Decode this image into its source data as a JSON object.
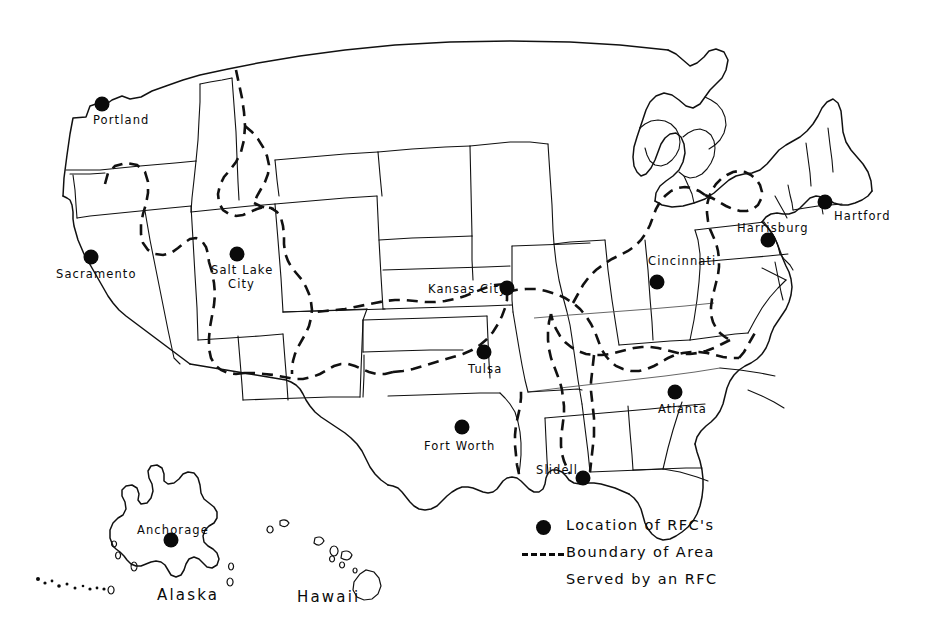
{
  "map": {
    "title": "Location of RFC's and Boundaries of Areas Served",
    "colors": {
      "ink": "#0a0a0a",
      "background": "#ffffff",
      "state_line": "#111111"
    },
    "cities": [
      {
        "name": "Portland",
        "label": "Portland",
        "dot_x": 102,
        "dot_y": 104,
        "label_x": 93,
        "label_y": 114,
        "anchor": "center"
      },
      {
        "name": "Sacramento",
        "label": "Sacramento",
        "dot_x": 91,
        "dot_y": 257,
        "label_x": 56,
        "label_y": 268,
        "anchor": "left"
      },
      {
        "name": "Salt Lake City",
        "label": "Salt Lake",
        "dot_x": 237,
        "dot_y": 254,
        "label_x": 211,
        "label_y": 264,
        "anchor": "left"
      },
      {
        "name": "Salt Lake City 2",
        "label": "City",
        "dot_x": 0,
        "dot_y": 0,
        "label_x": 228,
        "label_y": 278,
        "anchor": "left"
      },
      {
        "name": "Kansas City",
        "label": "Kansas City",
        "dot_x": 507,
        "dot_y": 288,
        "label_x": 428,
        "label_y": 283,
        "anchor": "left"
      },
      {
        "name": "Tulsa",
        "label": "Tulsa",
        "dot_x": 484,
        "dot_y": 352,
        "label_x": 468,
        "label_y": 363,
        "anchor": "left"
      },
      {
        "name": "Fort Worth",
        "label": "Fort Worth",
        "dot_x": 462,
        "dot_y": 427,
        "label_x": 424,
        "label_y": 440,
        "anchor": "left"
      },
      {
        "name": "Slidell",
        "label": "Slidell",
        "dot_x": 583,
        "dot_y": 478,
        "label_x": 536,
        "label_y": 464,
        "anchor": "left"
      },
      {
        "name": "Atlanta",
        "label": "Atlanta",
        "dot_x": 675,
        "dot_y": 392,
        "label_x": 658,
        "label_y": 403,
        "anchor": "left"
      },
      {
        "name": "Cincinnati",
        "label": "Cincinnati",
        "dot_x": 657,
        "dot_y": 282,
        "label_x": 648,
        "label_y": 255,
        "anchor": "left"
      },
      {
        "name": "Harrisburg",
        "label": "Harrisburg",
        "dot_x": 768,
        "dot_y": 240,
        "label_x": 737,
        "label_y": 222,
        "anchor": "left"
      },
      {
        "name": "Hartford",
        "label": "Hartford",
        "dot_x": 825,
        "dot_y": 202,
        "label_x": 834,
        "label_y": 210,
        "anchor": "left"
      },
      {
        "name": "Anchorage",
        "label": "Anchorage",
        "dot_x": 171,
        "dot_y": 540,
        "label_x": 137,
        "label_y": 524,
        "anchor": "left"
      }
    ],
    "regions": [
      {
        "name": "Alaska",
        "label": "Alaska",
        "x": 157,
        "y": 586
      },
      {
        "name": "Hawaii",
        "label": "Hawaii",
        "x": 297,
        "y": 588
      }
    ],
    "legend": {
      "dot_label": "Location of RFC's",
      "dash_label_line1": "Boundary of Area",
      "dash_label_line2": "Served by an RFC",
      "dot_icon": "filled-circle-icon",
      "dash_icon": "dashed-line-icon"
    }
  }
}
